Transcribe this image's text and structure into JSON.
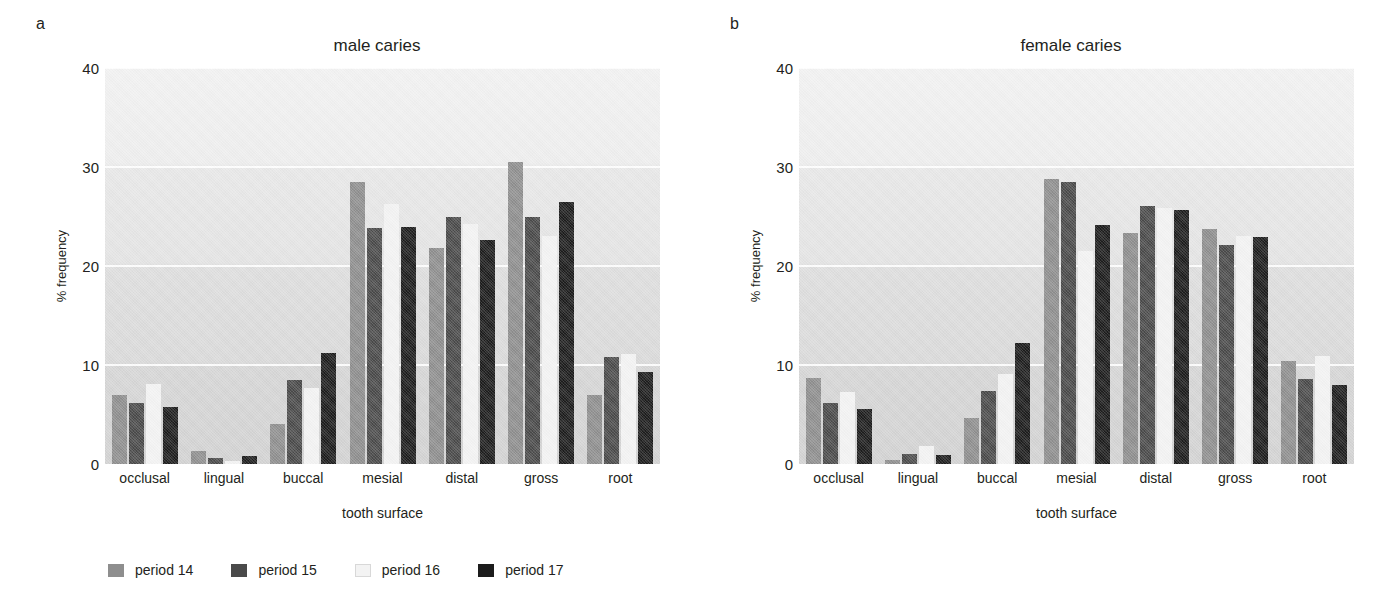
{
  "figure": {
    "panels": [
      {
        "letter": "a",
        "title": "male caries"
      },
      {
        "letter": "b",
        "title": "female caries"
      }
    ],
    "xlabel": "tooth surface",
    "ylabel": "% frequency",
    "yticks": [
      "0",
      "10",
      "20",
      "30",
      "40"
    ],
    "legend": [
      {
        "label": "period 14",
        "color": "#8e8e8e"
      },
      {
        "label": "period 15",
        "color": "#4a4a4a"
      },
      {
        "label": "period 16",
        "color": "#f3f3f3"
      },
      {
        "label": "period 17",
        "color": "#1c1c1c"
      }
    ]
  },
  "chart_data": [
    {
      "type": "bar",
      "panel": "a",
      "title": "male caries",
      "xlabel": "tooth surface",
      "ylabel": "% frequency",
      "ylim": [
        0,
        40
      ],
      "yticks": [
        0,
        10,
        20,
        30,
        40
      ],
      "grid": true,
      "legend_position": "below-figure",
      "categories": [
        "occlusal",
        "lingual",
        "buccal",
        "mesial",
        "distal",
        "gross",
        "root"
      ],
      "series": [
        {
          "name": "period 14",
          "color": "#8e8e8e",
          "values": [
            7.0,
            1.3,
            4.0,
            28.5,
            21.8,
            30.5,
            7.0
          ]
        },
        {
          "name": "period 15",
          "color": "#4a4a4a",
          "values": [
            6.2,
            0.6,
            8.5,
            23.8,
            25.0,
            25.0,
            10.8
          ]
        },
        {
          "name": "period 16",
          "color": "#f3f3f3",
          "values": [
            8.1,
            0.3,
            7.7,
            26.3,
            24.2,
            23.0,
            11.1
          ]
        },
        {
          "name": "period 17",
          "color": "#1c1c1c",
          "values": [
            5.8,
            0.8,
            11.2,
            23.9,
            22.6,
            26.5,
            9.3
          ]
        }
      ]
    },
    {
      "type": "bar",
      "panel": "b",
      "title": "female caries",
      "xlabel": "tooth surface",
      "ylabel": "% frequency",
      "ylim": [
        0,
        40
      ],
      "yticks": [
        0,
        10,
        20,
        30,
        40
      ],
      "grid": true,
      "legend_position": "below-figure",
      "categories": [
        "occlusal",
        "lingual",
        "buccal",
        "mesial",
        "distal",
        "gross",
        "root"
      ],
      "series": [
        {
          "name": "period 14",
          "color": "#8e8e8e",
          "values": [
            8.7,
            0.4,
            4.6,
            28.8,
            23.3,
            23.7,
            10.4
          ]
        },
        {
          "name": "period 15",
          "color": "#4a4a4a",
          "values": [
            6.2,
            1.0,
            7.4,
            28.5,
            26.1,
            22.1,
            8.6
          ]
        },
        {
          "name": "period 16",
          "color": "#f3f3f3",
          "values": [
            7.3,
            1.8,
            9.1,
            21.5,
            25.9,
            23.0,
            10.9
          ]
        },
        {
          "name": "period 17",
          "color": "#1c1c1c",
          "values": [
            5.6,
            0.9,
            12.2,
            24.1,
            25.7,
            22.9,
            8.0
          ]
        }
      ]
    }
  ]
}
